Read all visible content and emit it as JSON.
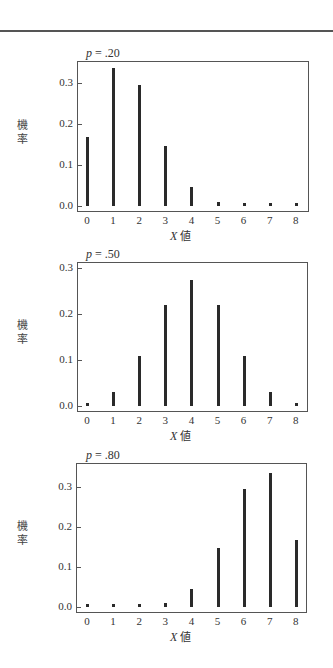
{
  "page": {
    "y_axis_label": "機率",
    "x_axis_label_var": "X",
    "x_axis_label_text": "値"
  },
  "chart_data": [
    {
      "type": "bar",
      "title": "p = .20",
      "title_var": "p",
      "title_value": "= .20",
      "xlabel": "X 値",
      "ylabel": "機率",
      "categories": [
        0,
        1,
        2,
        3,
        4,
        5,
        6,
        7,
        8
      ],
      "values": [
        0.168,
        0.336,
        0.294,
        0.147,
        0.046,
        0.009,
        0.001,
        0.0,
        0.0
      ],
      "yticks": [
        "0.0",
        "0.1",
        "0.2",
        "0.3"
      ],
      "ylim": [
        0,
        0.35
      ],
      "grid": false,
      "style": "spike"
    },
    {
      "type": "bar",
      "title": "p = .50",
      "title_var": "p",
      "title_value": "= .50",
      "xlabel": "X 値",
      "ylabel": "機率",
      "categories": [
        0,
        1,
        2,
        3,
        4,
        5,
        6,
        7,
        8
      ],
      "values": [
        0.004,
        0.031,
        0.109,
        0.219,
        0.273,
        0.219,
        0.109,
        0.031,
        0.004
      ],
      "yticks": [
        "0.0",
        "0.1",
        "0.2",
        "0.3"
      ],
      "ylim": [
        0,
        0.31
      ],
      "grid": false,
      "style": "spike"
    },
    {
      "type": "bar",
      "title": "p = .80",
      "title_var": "p",
      "title_value": "= .80",
      "xlabel": "X 値",
      "ylabel": "機率",
      "categories": [
        0,
        1,
        2,
        3,
        4,
        5,
        6,
        7,
        8
      ],
      "values": [
        0.0,
        0.0,
        0.001,
        0.009,
        0.046,
        0.147,
        0.294,
        0.336,
        0.168
      ],
      "yticks": [
        "0.0",
        "0.1",
        "0.2",
        "0.3"
      ],
      "ylim": [
        0,
        0.35
      ],
      "grid": false,
      "style": "spike"
    }
  ]
}
